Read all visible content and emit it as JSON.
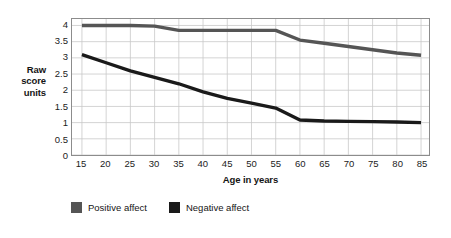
{
  "chart_data": {
    "type": "line",
    "title": "",
    "subtitle": "",
    "xlabel": "Age in years",
    "ylabel": "Raw score units",
    "ylabel_lines": [
      "Raw",
      "score",
      "units"
    ],
    "xlim": [
      15,
      85
    ],
    "ylim": [
      0,
      4.2
    ],
    "x_ticks": [
      15,
      20,
      25,
      30,
      35,
      40,
      45,
      50,
      55,
      60,
      65,
      70,
      75,
      80,
      85
    ],
    "x_tick_labels": [
      "15",
      "20",
      "25",
      "30",
      "35",
      "40",
      "45",
      "50",
      "55",
      "60",
      "65",
      "70",
      "75",
      "80",
      "85"
    ],
    "y_ticks": [
      0,
      0.5,
      1,
      1.5,
      2,
      2.5,
      3,
      3.5,
      4
    ],
    "y_tick_labels": [
      "0",
      "0.5",
      "1",
      "1.5",
      "2",
      "2.5",
      "3",
      "3.5",
      "4"
    ],
    "grid": true,
    "grid_color": "#c9c9c9",
    "plot_border_color": "#8c8c8c",
    "background_color": "#ffffff",
    "legend_position": "bottom-left",
    "x": [
      15,
      20,
      25,
      30,
      35,
      40,
      45,
      50,
      55,
      60,
      65,
      70,
      75,
      80,
      85
    ],
    "series": [
      {
        "name": "Positive affect",
        "color": "#555555",
        "values": [
          4.0,
          4.0,
          4.0,
          3.98,
          3.85,
          3.85,
          3.85,
          3.85,
          3.85,
          3.55,
          3.45,
          3.35,
          3.25,
          3.15,
          3.08
        ]
      },
      {
        "name": "Negative affect",
        "color": "#1a1a1a",
        "values": [
          3.1,
          2.85,
          2.6,
          2.4,
          2.2,
          1.95,
          1.75,
          1.6,
          1.45,
          1.08,
          1.05,
          1.04,
          1.03,
          1.02,
          1.0
        ]
      }
    ],
    "legend": [
      {
        "label": "Positive affect",
        "color": "#555555"
      },
      {
        "label": "Negative affect",
        "color": "#1a1a1a"
      }
    ]
  }
}
